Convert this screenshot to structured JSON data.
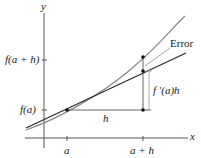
{
  "figure": {
    "axes": {
      "x_label": "x",
      "y_label": "y"
    },
    "y_ticks": [
      {
        "label": "f(a + h)"
      },
      {
        "label": "f(a)"
      }
    ],
    "x_ticks": [
      {
        "label": "a"
      },
      {
        "label": "a + h"
      }
    ],
    "annotations": {
      "h_label": "h",
      "derivative_label": "f ′(a)h",
      "error_label": "Error"
    },
    "colors": {
      "curve": "#8a8a8a",
      "tangent": "#2b2b2b",
      "axes": "#555555",
      "points": "#111111",
      "guides": "#888888"
    }
  }
}
